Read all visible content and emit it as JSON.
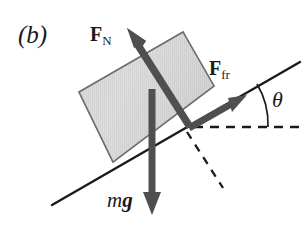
{
  "figure": {
    "panel_label": "(b)",
    "background_color": "#ffffff",
    "ink_color": "#1a1a1a",
    "arrow_color": "#4a4a4a",
    "block_fill_light": "#e3e3e3",
    "block_fill_dark": "#b8b8b8",
    "block_edge_color": "#6e6e6e"
  },
  "labels": {
    "normal_force": {
      "symbol": "F",
      "subscript": "N",
      "text": "F_N"
    },
    "friction_force": {
      "symbol": "F",
      "subscript": "fr",
      "text": "F_fr"
    },
    "weight": {
      "mass": "m",
      "gravity": "g",
      "text": "mg"
    },
    "angle": {
      "symbol": "θ",
      "text": "theta"
    }
  },
  "icons": {
    "normal_force_arrow": "arrow-up-left-icon",
    "friction_force_arrow": "arrow-up-right-icon",
    "weight_arrow": "arrow-down-icon",
    "incline_line": "line-icon",
    "horizontal_dashed_line": "dashed-line-icon",
    "normal_dashed_line": "dashed-line-icon",
    "angle_arc": "arc-icon",
    "block": "parallelogram-block-icon"
  },
  "geometry": {
    "incline_start": [
      52,
      205
    ],
    "incline_end": [
      300,
      62
    ],
    "vertex": [
      190,
      127
    ],
    "block_corners": [
      [
        79,
        92
      ],
      [
        183,
        32
      ],
      [
        214,
        86
      ],
      [
        113,
        162
      ]
    ],
    "normal_arrow": {
      "from": [
        190,
        127
      ],
      "to": [
        128,
        30
      ]
    },
    "friction_arrow": {
      "from": [
        190,
        127
      ],
      "to": [
        243,
        97
      ]
    },
    "weight_arrow": {
      "from": [
        152,
        90
      ],
      "to": [
        152,
        214
      ]
    },
    "horizontal_dashed": {
      "from": [
        193,
        127
      ],
      "to": [
        300,
        127
      ]
    },
    "normal_dashed": {
      "from": [
        188,
        131
      ],
      "to": [
        222,
        185
      ]
    },
    "angle_arc": {
      "center": [
        190,
        127
      ],
      "radius": 78,
      "start_deg": 0,
      "end_deg": -30
    }
  }
}
